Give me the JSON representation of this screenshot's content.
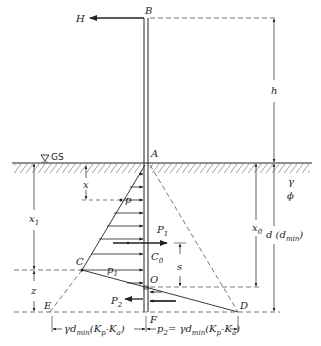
{
  "labels": {
    "B": "B",
    "H": "H",
    "A": "A",
    "GS": "GS",
    "h": "h",
    "gamma": "γ",
    "phi": "ϕ",
    "x": "x",
    "p": "p",
    "x1": "x",
    "x1_sub": "1",
    "P1": "P",
    "P1_sub": "1",
    "C0": "C",
    "C0_sub": "0",
    "s": "s",
    "C": "C",
    "p1": "p",
    "p1_sub": "1",
    "O": "O",
    "x0": "x",
    "x0_sub": "0",
    "d": "d (d",
    "d_sub": "min",
    "d_close": ")",
    "z": "z",
    "E": "E",
    "P2": "P",
    "P2_sub": "2",
    "D": "D",
    "F": "F",
    "dim_left": "γd",
    "dim_left_sub": "min",
    "dim_left_rest": "(K",
    "dim_left_p": "p",
    "dim_left_minus": "-K",
    "dim_left_a": "a",
    "dim_left_close": ")",
    "dim_right_p": "p",
    "dim_right_sub": "2",
    "dim_right_eq": "= γd",
    "dim_right_min": "min",
    "dim_right_rest": "(K",
    "dim_right_p2": "p",
    "dim_right_minus": "-K",
    "dim_right_a": "a",
    "dim_right_close": ")"
  },
  "colors": {
    "line": "#222222",
    "dashed": "#555555",
    "hatch": "#777777"
  }
}
